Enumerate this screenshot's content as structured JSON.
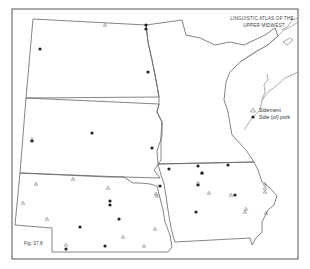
{
  "map": {
    "title_line1": "LINGUISTIC ATLAS OF THE",
    "title_line2": "UPPER MIDWEST",
    "figure_label": "Fig. 37.8",
    "legend": {
      "items": [
        {
          "symbol": "triangle-open",
          "label": "Sidement"
        },
        {
          "symbol": "dot-filled",
          "label": "Side (of) pork"
        }
      ]
    },
    "colors": {
      "line": "#666666",
      "dot": "#222222",
      "triangle": "#777777",
      "background": "#ffffff"
    },
    "regions": [
      "North Dakota",
      "South Dakota",
      "Nebraska",
      "Minnesota",
      "Iowa"
    ],
    "markers": {
      "dots": [
        [
          146,
          25
        ],
        [
          146,
          29
        ],
        [
          40,
          49
        ],
        [
          148,
          72
        ],
        [
          32,
          141
        ],
        [
          92,
          133
        ],
        [
          152,
          148
        ],
        [
          160,
          186
        ],
        [
          110,
          201
        ],
        [
          110,
          205
        ],
        [
          119,
          219
        ],
        [
          80,
          227
        ],
        [
          66,
          249
        ],
        [
          105,
          246
        ],
        [
          169,
          169
        ],
        [
          198,
          166
        ],
        [
          202,
          173
        ],
        [
          198,
          185
        ],
        [
          228,
          165
        ],
        [
          235,
          195
        ],
        [
          196,
          212
        ]
      ],
      "triangles": [
        [
          105,
          25
        ],
        [
          32,
          139
        ],
        [
          36,
          184
        ],
        [
          73,
          179
        ],
        [
          108,
          188
        ],
        [
          23,
          203
        ],
        [
          47,
          219
        ],
        [
          156,
          194
        ],
        [
          123,
          237
        ],
        [
          144,
          246
        ],
        [
          155,
          229
        ],
        [
          66,
          245
        ],
        [
          157,
          196
        ],
        [
          198,
          183
        ],
        [
          202,
          173
        ],
        [
          209,
          193
        ],
        [
          231,
          195
        ],
        [
          246,
          209
        ],
        [
          245,
          212
        ],
        [
          265,
          184
        ],
        [
          265,
          188
        ],
        [
          265,
          192
        ],
        [
          266,
          213
        ]
      ]
    }
  }
}
